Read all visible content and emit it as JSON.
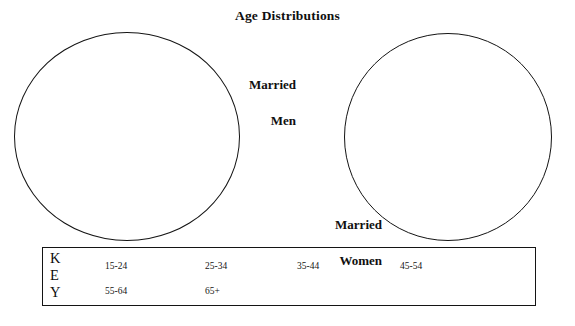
{
  "chart_data": {
    "type": "pie",
    "title": "Age Distributions",
    "charts": [
      {
        "name": "Married Men",
        "label": "Married\nMen",
        "categories": [
          "15-24",
          "25-34",
          "35-44",
          "45-54",
          "55-64",
          "65+"
        ],
        "values": [
          null,
          null,
          null,
          null,
          null,
          null
        ],
        "rendered": "empty outline, no slices drawn"
      },
      {
        "name": "Married Women",
        "label": "Married\nWomen",
        "categories": [
          "15-24",
          "25-34",
          "35-44",
          "45-54",
          "55-64",
          "65+"
        ],
        "values": [
          null,
          null,
          null,
          null,
          null,
          null
        ],
        "rendered": "empty outline, no slices drawn"
      }
    ],
    "legend": {
      "title": "KEY",
      "position": "bottom",
      "entries": [
        "15-24",
        "25-34",
        "35-44",
        "45-54",
        "55-64",
        "65+"
      ]
    },
    "xlabel": "",
    "ylabel": "",
    "grid": false
  },
  "title": "Age Distributions",
  "pies": {
    "men": {
      "line1": "Married",
      "line2": "Men"
    },
    "women": {
      "line1": "Married",
      "line2": "Women"
    }
  },
  "key": {
    "letters": {
      "k": "K",
      "e": "E",
      "y": "Y"
    },
    "entries": [
      {
        "label": "15-24"
      },
      {
        "label": "25-34"
      },
      {
        "label": "35-44"
      },
      {
        "label": "45-54"
      },
      {
        "label": "55-64"
      },
      {
        "label": "65+"
      }
    ]
  },
  "colors": {
    "ink": "#141414",
    "background": "#ffffff"
  }
}
